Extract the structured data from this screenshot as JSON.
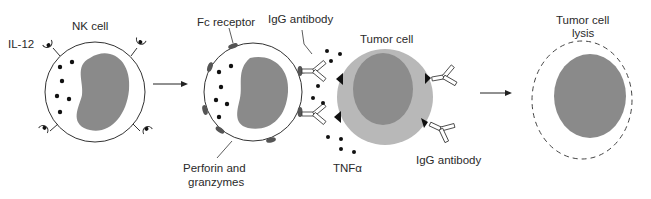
{
  "diagram": {
    "labels": {
      "nk_cell": "NK cell",
      "il12": "IL-12",
      "fc_receptor": "Fc receptor",
      "igg_antibody_top": "IgG antibody",
      "tumor_cell": "Tumor cell",
      "perforin_line1": "Perforin and",
      "perforin_line2": "granzymes",
      "tnf": "TNFα",
      "igg_antibody_bottom": "IgG antibody",
      "lysis_line1": "Tumor cell",
      "lysis_line2": "lysis"
    },
    "stages": [
      {
        "name": "resting-nk-cell",
        "description": "NK cell with IL-12 receptors and cytoplasmic granules"
      },
      {
        "name": "adcc-engagement",
        "description": "NK cell Fc receptors bind IgG antibodies coating tumor cell; perforin, granzymes and TNFα released"
      },
      {
        "name": "tumor-cell-lysis",
        "description": "Lysed tumor cell with dashed (disrupted) membrane"
      }
    ],
    "colors": {
      "nucleus": "#8a8a8a",
      "tumor_cytoplasm": "#b8b8b8",
      "tumor_nucleus": "#8c8c8c",
      "outline": "#333333",
      "granule": "#111111"
    }
  }
}
